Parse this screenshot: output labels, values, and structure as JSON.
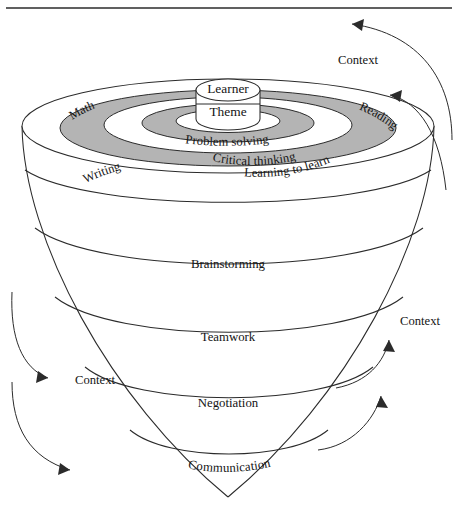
{
  "figure": {
    "type": "funnel-cone-concentric-rings-diagram",
    "top_rule": true,
    "background": "#ffffff",
    "ink_color": "#2b2b2b",
    "ring_fill_gray": "#b4b4b4",
    "ring_fill_white": "#ffffff"
  },
  "core": {
    "cylinder_top_label": "Learner",
    "cylinder_body_label": "Theme"
  },
  "rings": [
    {
      "label": "Problem solving",
      "shade": "white"
    },
    {
      "label": "Critical thinking",
      "shade": "gray"
    },
    {
      "label": "Learning to learn",
      "shade": "gray"
    }
  ],
  "rim_labels": [
    {
      "label": "Math",
      "side": "left"
    },
    {
      "label": "Reading",
      "side": "right"
    },
    {
      "label": "Writing",
      "side": "left"
    }
  ],
  "bands": [
    {
      "label": "Brainstorming"
    },
    {
      "label": "Teamwork"
    },
    {
      "label": "Negotiation"
    },
    {
      "label": "Communication"
    }
  ],
  "context_labels": [
    {
      "label": "Context",
      "position": "top-right"
    },
    {
      "label": "Context",
      "position": "middle-right"
    },
    {
      "label": "Context",
      "position": "left"
    }
  ]
}
